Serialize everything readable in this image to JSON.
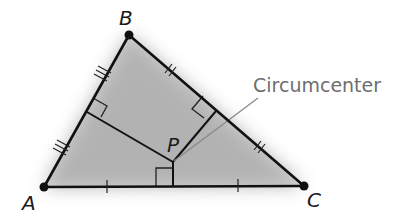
{
  "diagram": {
    "type": "geometry",
    "colors": {
      "stroke": "#111111",
      "shade": "#9a9a9a",
      "callout_text": "#6e6e6e",
      "leader": "#8a8a8a"
    },
    "vertices": [
      {
        "id": "A",
        "label": "A",
        "x": 44,
        "y": 187
      },
      {
        "id": "B",
        "label": "B",
        "x": 129,
        "y": 35
      },
      {
        "id": "C",
        "label": "C",
        "x": 304,
        "y": 186
      }
    ],
    "point": {
      "id": "P",
      "label": "P",
      "x": 173,
      "y": 162
    },
    "callout": {
      "text": "Circumcenter",
      "points_to": "P"
    },
    "perpendicular_bisectors": [
      {
        "side": "AB",
        "foot": [
          87,
          112
        ],
        "tick_marks": 3
      },
      {
        "side": "BC",
        "foot": [
          216,
          111
        ],
        "tick_marks": 2
      },
      {
        "side": "AC",
        "foot": [
          173,
          186
        ],
        "tick_marks": 1
      }
    ]
  }
}
